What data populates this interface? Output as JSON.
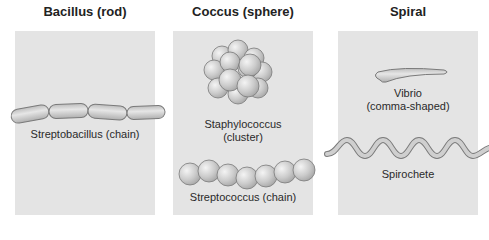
{
  "columns": [
    {
      "title": "Bacillus (rod)",
      "examples": [
        {
          "name": "Streptobacillus (chain)",
          "shape": "chain-of-rods"
        }
      ]
    },
    {
      "title": "Coccus (sphere)",
      "examples": [
        {
          "name_line1": "Staphylococcus",
          "name_line2": "(cluster)",
          "shape": "cluster-of-spheres"
        },
        {
          "name": "Streptococcus (chain)",
          "shape": "chain-of-spheres"
        }
      ]
    },
    {
      "title": "Spiral",
      "examples": [
        {
          "name_line1": "Vibrio",
          "name_line2": "(comma-shaped)",
          "shape": "comma"
        },
        {
          "name": "Spirochete",
          "shape": "helix"
        }
      ]
    }
  ],
  "colors": {
    "panel_bg": "#e4e4e4",
    "cell_fill": "#cfcfcf",
    "cell_stroke": "#7a7a7a",
    "page_bg": "#ffffff"
  }
}
